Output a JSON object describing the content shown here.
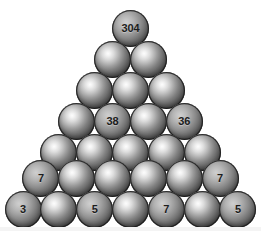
{
  "diagram": {
    "type": "pyramid",
    "row_count": 7,
    "background_color": "#ffffff",
    "ball_fill_color": "#7e7e7e",
    "ball_text_color": "#1c1c1c",
    "rows": [
      {
        "index": 1,
        "y": 10,
        "balls": [
          {
            "value": "304"
          }
        ]
      },
      {
        "index": 2,
        "y": 41,
        "balls": [
          {
            "value": ""
          },
          {
            "value": ""
          }
        ]
      },
      {
        "index": 3,
        "y": 72,
        "balls": [
          {
            "value": ""
          },
          {
            "value": ""
          },
          {
            "value": ""
          }
        ]
      },
      {
        "index": 4,
        "y": 103,
        "balls": [
          {
            "value": ""
          },
          {
            "value": "38"
          },
          {
            "value": ""
          },
          {
            "value": "36"
          }
        ]
      },
      {
        "index": 5,
        "y": 134,
        "balls": [
          {
            "value": ""
          },
          {
            "value": ""
          },
          {
            "value": ""
          },
          {
            "value": ""
          },
          {
            "value": ""
          }
        ]
      },
      {
        "index": 6,
        "y": 160,
        "balls": [
          {
            "value": "7"
          },
          {
            "value": ""
          },
          {
            "value": ""
          },
          {
            "value": ""
          },
          {
            "value": ""
          },
          {
            "value": "7"
          }
        ]
      },
      {
        "index": 7,
        "y": 191,
        "balls": [
          {
            "value": "3"
          },
          {
            "value": ""
          },
          {
            "value": "5"
          },
          {
            "value": ""
          },
          {
            "value": "7"
          },
          {
            "value": ""
          },
          {
            "value": "5"
          }
        ]
      }
    ]
  }
}
